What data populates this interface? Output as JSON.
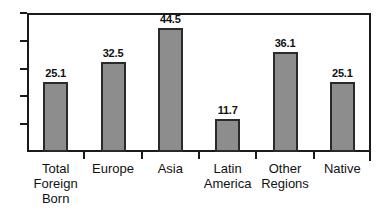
{
  "chart_data": {
    "type": "bar",
    "title": "",
    "subtitle": "",
    "xlabel": "",
    "ylabel": "",
    "ylim": [
      0,
      50
    ],
    "grid": false,
    "legend": null,
    "legend_position": "none",
    "axis_ticks": {
      "y_tick_count": 5,
      "y_tick_labels": [],
      "x_ticks_at_category_boundaries": true
    },
    "bar_style": {
      "fill": "#8d8d8d",
      "edge": "#2a2a2a"
    },
    "categories": [
      "Total Foreign Born",
      "Europe",
      "Asia",
      "Latin America",
      "Other Regions",
      "Native"
    ],
    "category_lines": [
      [
        "Total",
        "Foreign",
        "Born"
      ],
      [
        "Europe"
      ],
      [
        "Asia"
      ],
      [
        "Latin",
        "America"
      ],
      [
        "Other",
        "Regions"
      ],
      [
        "Native"
      ]
    ],
    "values": [
      25.1,
      32.5,
      44.5,
      11.7,
      36.1,
      25.1
    ],
    "value_labels": [
      "25.1",
      "32.5",
      "44.5",
      "11.7",
      "36.1",
      "25.1"
    ]
  }
}
